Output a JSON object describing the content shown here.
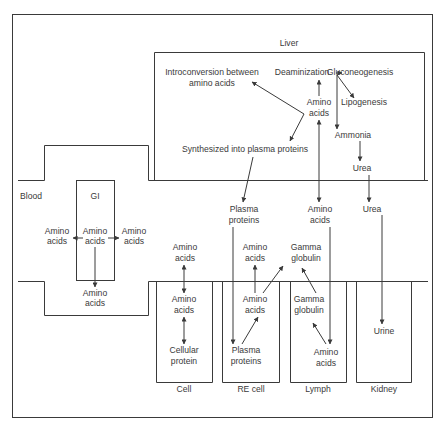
{
  "compartments": {
    "liver": "Liver",
    "blood": "Blood",
    "gi": "GI",
    "cell": "Cell",
    "re_cell": "RE cell",
    "lymph": "Lymph",
    "kidney": "Kidney"
  },
  "liver": {
    "introconversion_1": "Introconversion between",
    "introconversion_2": "amino acids",
    "deamination": "Deaminization",
    "gluconeogenesis": "Gluconeogenesis",
    "lipogenesis": "Lipogenesis",
    "amino_1": "Amino",
    "amino_2": "acids",
    "ammonia": "Ammonia",
    "urea": "Urea",
    "synthesized": "Synthesized into plasma proteins"
  },
  "blood": {
    "plasma_1": "Plasma",
    "plasma_2": "proteins",
    "amino_1": "Amino",
    "amino_2": "acids",
    "urea": "Urea",
    "cell_amino_1": "Amino",
    "cell_amino_2": "acids",
    "re_amino_1": "Amino",
    "re_amino_2": "acids",
    "gamma_1": "Gamma",
    "gamma_2": "globulin"
  },
  "gi": {
    "left_1": "Amino",
    "left_2": "acids",
    "center_1": "Amino",
    "center_2": "acids",
    "right_1": "Amino",
    "right_2": "acids",
    "bottom_1": "Amino",
    "bottom_2": "acids"
  },
  "cell": {
    "amino_1": "Amino",
    "amino_2": "acids",
    "protein_1": "Cellular",
    "protein_2": "protein"
  },
  "re_cell": {
    "amino_1": "Amino",
    "amino_2": "acids",
    "plasma_1": "Plasma",
    "plasma_2": "proteins"
  },
  "lymph": {
    "gamma_1": "Gamma",
    "gamma_2": "globulin",
    "amino_1": "Amino",
    "amino_2": "acids"
  },
  "kidney": {
    "urine": "Urine"
  }
}
